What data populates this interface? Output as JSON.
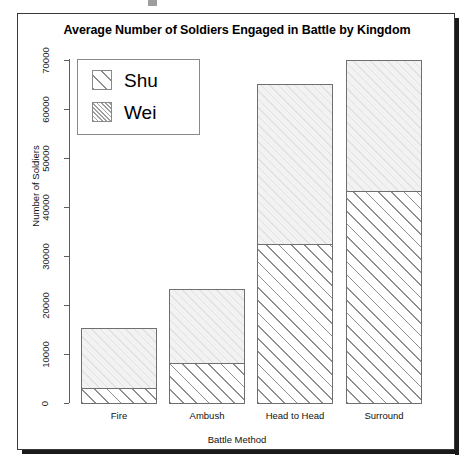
{
  "chart_data": {
    "type": "bar",
    "subtype": "stacked",
    "title": "Average Number of Soldiers Engaged in Battle by Kingdom",
    "xlabel": "Battle Method",
    "ylabel": "Number of Soldiers",
    "categories": [
      "Fire",
      "Ambush",
      "Head to Head",
      "Surround"
    ],
    "series": [
      {
        "name": "Wei",
        "values": [
          2900,
          8000,
          31500,
          43000
        ]
      },
      {
        "name": "Shu",
        "values": [
          11600,
          14500,
          33500,
          27000
        ]
      }
    ],
    "totals": [
      14500,
      22500,
      65000,
      70000
    ],
    "ylim": [
      0,
      70000
    ],
    "yticks": [
      0,
      10000,
      20000,
      30000,
      40000,
      50000,
      60000,
      70000
    ],
    "ytick_labels": [
      "0",
      "10000",
      "20000",
      "30000",
      "40000",
      "50000",
      "60000",
      "70000"
    ],
    "grid": false,
    "legend": {
      "position": "top-left",
      "entries": [
        {
          "label": "Shu",
          "pattern": "sparse-diagonal-hatch"
        },
        {
          "label": "Wei",
          "pattern": "dense-diagonal-hatch"
        }
      ]
    },
    "colors": {
      "shu_fill": "#f2f2f2",
      "wei_hatch": "#8e8e8e",
      "bar_border": "#6f6f6f",
      "axis": "#5e5e5e",
      "text": "#111111",
      "panel_border": "#3a3a3a"
    }
  },
  "bars": [
    {
      "label": "Fire",
      "x": 63,
      "width": 76,
      "wei_top": 374,
      "wei_bottom": 389,
      "shu_top": 314,
      "shu_bottom": 374
    },
    {
      "label": "Ambush",
      "x": 151,
      "width": 76,
      "wei_top": 349,
      "wei_bottom": 389,
      "shu_top": 275,
      "shu_bottom": 349
    },
    {
      "label": "Head to Head",
      "x": 239,
      "width": 76,
      "wei_top": 230,
      "wei_bottom": 389,
      "shu_top": 70,
      "shu_bottom": 230
    },
    {
      "label": "Surround",
      "x": 328,
      "width": 76,
      "wei_top": 177,
      "wei_bottom": 389,
      "shu_top": 46,
      "shu_bottom": 177
    }
  ],
  "axis_geometry": {
    "ticks": [
      {
        "label": "70000",
        "top": 46
      },
      {
        "label": "60000",
        "top": 95
      },
      {
        "label": "50000",
        "top": 144
      },
      {
        "label": "40000",
        "top": 193
      },
      {
        "label": "30000",
        "top": 242
      },
      {
        "label": "20000",
        "top": 291
      },
      {
        "label": "10000",
        "top": 340
      },
      {
        "label": "0",
        "top": 389
      }
    ]
  }
}
